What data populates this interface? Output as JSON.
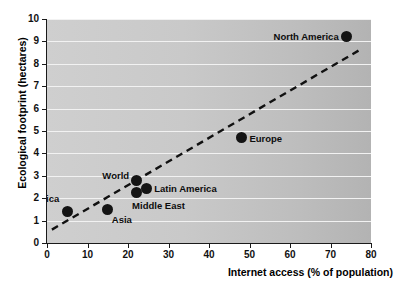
{
  "figure": {
    "top_caption_remnant": "·  ·   ·    ·     ·      ·",
    "background_color": "#ffffff",
    "plot_background_color": "#c9c9c9",
    "gridline_color": "#f2f2f2",
    "marker_color": "#141414",
    "trendline_color": "#111111",
    "axis_color": "#1a1a1a"
  },
  "chart_data": {
    "type": "scatter",
    "title": "",
    "xlabel": "Internet access (% of population)",
    "ylabel": "Ecological footprint (hectares)",
    "xlim": [
      0,
      80
    ],
    "ylim": [
      0,
      10
    ],
    "xticks": [
      0,
      10,
      20,
      30,
      40,
      50,
      60,
      70,
      80
    ],
    "yticks": [
      0,
      1,
      2,
      3,
      4,
      5,
      6,
      7,
      8,
      9,
      10
    ],
    "xtick_labels": [
      "0",
      "10",
      "20",
      "30",
      "40",
      "50",
      "60",
      "70",
      "80"
    ],
    "ytick_labels": [
      "0",
      "1",
      "2",
      "3",
      "4",
      "5",
      "6",
      "7",
      "8",
      "9",
      "10"
    ],
    "grid": "horizontal",
    "legend": "none",
    "points": [
      {
        "label": "Africa",
        "x": 5.0,
        "y": 1.4,
        "label_side": "left",
        "label_dx": -8,
        "label_dy": -13
      },
      {
        "label": "Asia",
        "x": 15.0,
        "y": 1.5,
        "label_side": "right",
        "label_dx": 4,
        "label_dy": 11
      },
      {
        "label": "World",
        "x": 22.0,
        "y": 2.8,
        "label_side": "left",
        "label_dx": -7,
        "label_dy": -4
      },
      {
        "label": "Middle East",
        "x": 22.0,
        "y": 2.25,
        "label_side": "right",
        "label_dx": -4,
        "label_dy": 13
      },
      {
        "label": "Latin America",
        "x": 24.5,
        "y": 2.45,
        "label_side": "right",
        "label_dx": 8,
        "label_dy": 1
      },
      {
        "label": "Europe",
        "x": 48.0,
        "y": 4.7,
        "label_side": "right",
        "label_dx": 8,
        "label_dy": 1
      },
      {
        "label": "North America",
        "x": 74.0,
        "y": 9.2,
        "label_side": "left",
        "label_dx": -8,
        "label_dy": 0
      }
    ],
    "trendline": {
      "style": "dashed",
      "x_start": 1.2,
      "y_start": 0.6,
      "x_end": 77.0,
      "y_end": 8.6
    }
  }
}
